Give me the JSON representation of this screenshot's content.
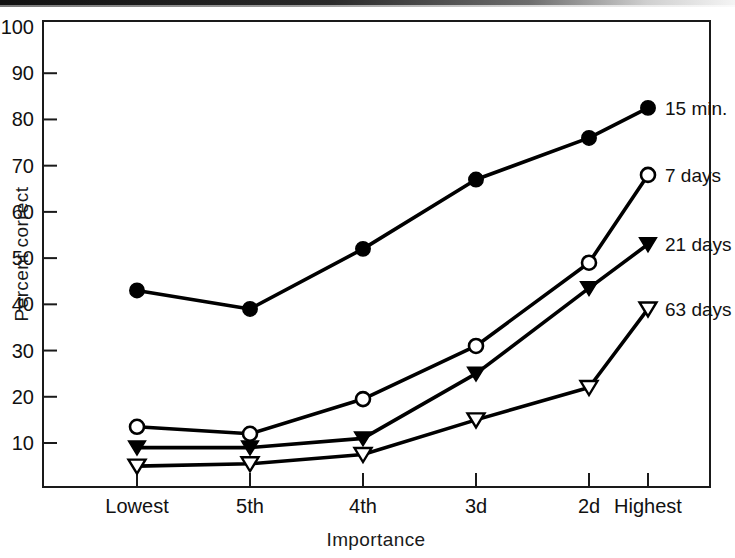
{
  "chart_data": {
    "type": "line",
    "title": "",
    "xlabel": "Importance",
    "ylabel": "Percent correct",
    "categories": [
      "Lowest",
      "5th",
      "4th",
      "3d",
      "2d",
      "Highest"
    ],
    "ylim": [
      0,
      100
    ],
    "yticks": [
      10,
      20,
      30,
      40,
      50,
      60,
      70,
      80,
      90,
      100
    ],
    "grid": false,
    "legend_position": "right-inline-end-of-line",
    "series": [
      {
        "name": "15 min.",
        "marker": "filled-circle",
        "values": [
          43,
          39,
          52,
          67,
          76,
          82.5
        ]
      },
      {
        "name": "7 days",
        "marker": "open-circle",
        "values": [
          13.5,
          12,
          19.5,
          31,
          49,
          68
        ]
      },
      {
        "name": "21 days",
        "marker": "filled-triangle-down",
        "values": [
          9,
          9,
          11,
          25,
          43.5,
          53
        ]
      },
      {
        "name": "63 days",
        "marker": "open-triangle-down",
        "values": [
          5,
          5.5,
          7.5,
          15,
          22,
          39
        ]
      }
    ]
  },
  "axes": {
    "y_title": "Percent correct",
    "x_title": "Importance",
    "y_tick_labels": [
      "100",
      "90",
      "80",
      "70",
      "60",
      "50",
      "40",
      "30",
      "20",
      "10"
    ],
    "x_tick_labels": [
      "Lowest",
      "5th",
      "4th",
      "3d",
      "2d",
      "Highest"
    ]
  },
  "legend": {
    "items": [
      {
        "label": "15 min."
      },
      {
        "label": "7 days"
      },
      {
        "label": "21 days"
      },
      {
        "label": "63 days"
      }
    ]
  },
  "colors": {
    "ink": "#000000",
    "paper": "#ffffff"
  }
}
